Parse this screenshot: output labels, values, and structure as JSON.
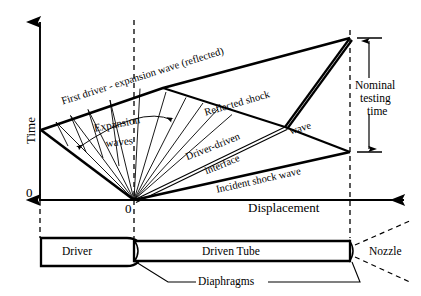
{
  "figure": {
    "type": "shock-tube-wave-diagram",
    "axes": {
      "y_label": "Time",
      "x_label": "Displacement",
      "origin_y_label": "0",
      "origin_x_label": "0"
    },
    "annotations": {
      "first_driver_expansion": "First driver - expansion wave (reflected)",
      "expansion_waves_line1": "Expansion",
      "expansion_waves_line2": "waves",
      "reflected_shock": "Reflected shock",
      "reflected_shock_cont": "wave",
      "driver_driven_line1": "Driver-driven",
      "driver_driven_line2": "interface",
      "incident_shock": "Incident shock wave",
      "nominal_line1": "Nominal",
      "nominal_line2": "testing",
      "nominal_line3": "time"
    },
    "apparatus": {
      "driver": "Driver",
      "driven_tube": "Driven Tube",
      "nozzle": "Nozzle",
      "diaphragms": "Diaphragms"
    },
    "colors": {
      "ink": "#000000",
      "background": "#ffffff"
    },
    "geometry": {
      "y_axis_x": 40,
      "x_axis_y": 200,
      "origin_x": 134,
      "right_wall_x": 350,
      "apex_top_y": 38,
      "incident_hit_y": 152,
      "left_reflect_y": 130,
      "fan_kink_x": 163,
      "fan_kink_y": 88,
      "triple_point_x": 285,
      "triple_point_y": 127
    }
  }
}
